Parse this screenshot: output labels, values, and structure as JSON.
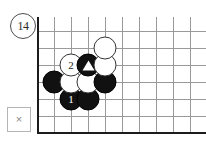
{
  "diagram": {
    "number_label": "14",
    "number_badge_name": "diagram-number-14"
  },
  "close_box": {
    "icon_label": "×",
    "icon_name": "close-icon"
  },
  "board": {
    "type": "go-board",
    "columns": 10,
    "rows": 7,
    "cell_size": 17,
    "left_edge_is_board_boundary": true,
    "bottom_edge_is_board_boundary": true,
    "grid_color": "#9a9a9a",
    "edge_color": "#1c1c1c",
    "background_color": "#ffffff",
    "stones": [
      {
        "name": "black-stone-move-1",
        "color": "black",
        "col": 2,
        "row": 2,
        "label": "1",
        "marker": ""
      },
      {
        "name": "black-stone-a",
        "color": "black",
        "col": 3,
        "row": 2,
        "label": "",
        "marker": ""
      },
      {
        "name": "black-stone-b",
        "color": "black",
        "col": 1,
        "row": 3,
        "label": "",
        "marker": ""
      },
      {
        "name": "white-stone-a",
        "color": "white",
        "col": 2,
        "row": 3,
        "label": "",
        "marker": ""
      },
      {
        "name": "white-stone-b",
        "color": "white",
        "col": 3,
        "row": 3,
        "label": "",
        "marker": ""
      },
      {
        "name": "black-stone-c",
        "color": "black",
        "col": 4,
        "row": 3,
        "label": "",
        "marker": ""
      },
      {
        "name": "white-stone-move-2",
        "color": "white",
        "col": 2,
        "row": 4,
        "label": "2",
        "marker": ""
      },
      {
        "name": "black-stone-marked-triangle",
        "color": "black",
        "col": 3,
        "row": 4,
        "label": "",
        "marker": "triangle"
      },
      {
        "name": "white-stone-c",
        "color": "white",
        "col": 4,
        "row": 4,
        "label": "",
        "marker": ""
      },
      {
        "name": "white-stone-d",
        "color": "white",
        "col": 4,
        "row": 5,
        "label": "",
        "marker": ""
      }
    ]
  }
}
